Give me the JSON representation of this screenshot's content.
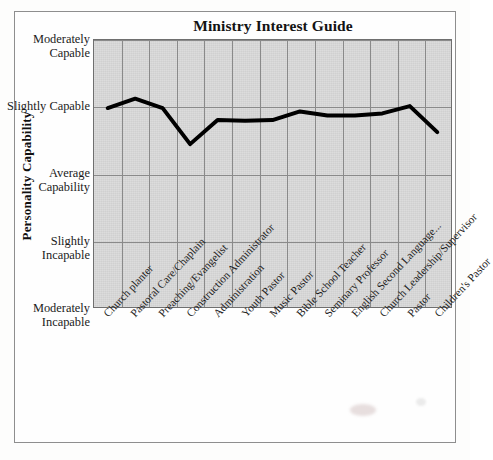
{
  "chart_data": {
    "type": "line",
    "title": "Ministry Interest Guide",
    "xlabel": "",
    "ylabel": "Personality Capability",
    "grid": true,
    "legend": "none",
    "categories": [
      "Church planter",
      "Pastoral Care/Chaplain",
      "Preaching/Evangelist",
      "Construction Administrator",
      "Administration",
      "Youth Pastor",
      "Music Pastor",
      "Bible School Teacher",
      "Seminary Professor",
      "English Second Language...",
      "Church Leadership/Supervisor",
      "Pastor",
      "Children's Pastor"
    ],
    "values": [
      3.98,
      4.12,
      3.98,
      3.44,
      3.8,
      3.79,
      3.8,
      3.93,
      3.87,
      3.87,
      3.9,
      4.01,
      3.62
    ],
    "ylim": [
      1,
      5
    ],
    "ytick_values": [
      5,
      4,
      3,
      2,
      1
    ],
    "ytick_labels": [
      "Moderately Capable",
      "Slightly Capable",
      "Average Capability",
      "Slightly Incapable",
      "Moderately Incapable"
    ],
    "series": [
      {
        "name": "Personality Capability",
        "values": [
          3.98,
          4.12,
          3.98,
          3.44,
          3.8,
          3.79,
          3.8,
          3.93,
          3.87,
          3.87,
          3.9,
          4.01,
          3.62
        ],
        "color": "#000000",
        "line_width": 4
      }
    ],
    "colors": {
      "plot_background": "#d4d4d4",
      "gridline": "#8a8a8a",
      "line": "#000000",
      "frame": "#6f6f6f",
      "text": "#1b1b1b"
    }
  }
}
